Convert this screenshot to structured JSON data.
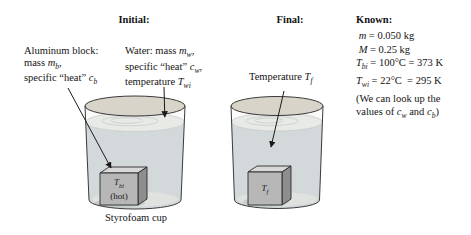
{
  "titles": {
    "initial": "Initial:",
    "final": "Final:",
    "known": "Known:"
  },
  "labels": {
    "aluminum_block": {
      "lines": [
        [
          {
            "t": "n",
            "s": "Aluminum block:"
          }
        ],
        [
          {
            "t": "n",
            "s": "mass "
          },
          {
            "t": "i",
            "s": "m"
          },
          {
            "t": "sub",
            "s": "b"
          },
          {
            "t": "n",
            "s": ","
          }
        ],
        [
          {
            "t": "n",
            "s": "specific “heat” "
          },
          {
            "t": "i",
            "s": "c"
          },
          {
            "t": "sub",
            "s": "b"
          }
        ]
      ]
    },
    "water": {
      "lines": [
        [
          {
            "t": "n",
            "s": "Water: mass "
          },
          {
            "t": "i",
            "s": "m"
          },
          {
            "t": "sub",
            "s": "w"
          },
          {
            "t": "n",
            "s": ","
          }
        ],
        [
          {
            "t": "n",
            "s": "specific “heat” "
          },
          {
            "t": "i",
            "s": "c"
          },
          {
            "t": "sub",
            "s": "w"
          },
          {
            "t": "n",
            "s": ","
          }
        ],
        [
          {
            "t": "n",
            "s": "temperature "
          },
          {
            "t": "i",
            "s": "T"
          },
          {
            "t": "sub",
            "s": "wi"
          }
        ]
      ]
    },
    "final_temperature": [
      {
        "t": "n",
        "s": "Temperature "
      },
      {
        "t": "i",
        "s": "T"
      },
      {
        "t": "sub",
        "s": "f"
      }
    ],
    "caption": "Styrofoam cup",
    "block_initial": {
      "line1": [
        {
          "t": "i",
          "s": "T"
        },
        {
          "t": "sub",
          "s": "bi"
        }
      ],
      "line2": [
        {
          "t": "n",
          "s": "(hot)"
        }
      ]
    },
    "block_final": {
      "line1": [
        {
          "t": "i",
          "s": "T"
        },
        {
          "t": "sub",
          "s": "f"
        }
      ]
    }
  },
  "known": {
    "lines": [
      [
        {
          "t": "n",
          "s": " "
        },
        {
          "t": "i",
          "s": "m"
        },
        {
          "t": "n",
          "s": " = 0.050 kg"
        }
      ],
      [
        {
          "t": "n",
          "s": " "
        },
        {
          "t": "i",
          "s": "M"
        },
        {
          "t": "n",
          "s": " = 0.25 kg"
        }
      ],
      [
        {
          "t": "i",
          "s": "T"
        },
        {
          "t": "sub",
          "s": "bi"
        },
        {
          "t": "n",
          "s": " = 100°C = 373 K"
        }
      ],
      [
        {
          "t": "i",
          "s": "T"
        },
        {
          "t": "sub",
          "s": "wi"
        },
        {
          "t": "n",
          "s": " = 22°C  = 295 K"
        }
      ],
      [
        {
          "t": "n",
          "s": "(We can look up the"
        }
      ],
      [
        {
          "t": "n",
          "s": "values of "
        },
        {
          "t": "i",
          "s": "c"
        },
        {
          "t": "sub",
          "s": "w"
        },
        {
          "t": "n",
          "s": " and "
        },
        {
          "t": "i",
          "s": "c"
        },
        {
          "t": "sub",
          "s": "b"
        },
        {
          "t": "n",
          "s": ")"
        }
      ]
    ]
  },
  "colors": {
    "cup_interior": "#fbfbf9",
    "cup_rim": "#d9d4ca",
    "water_body": "#d3d8da",
    "water_surface": "#e8eae6",
    "cup_floor": "#e0e2df",
    "block_shadow": "#b7bbbc",
    "ripple": "#c8cdcb",
    "block_front": "#b7b7b7",
    "block_top": "#d8d8d8",
    "block_side": "#8e8e8e"
  }
}
